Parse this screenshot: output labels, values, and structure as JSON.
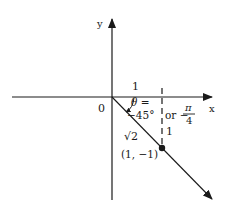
{
  "diagram": {
    "axes": {
      "x_label": "x",
      "y_label": "y",
      "origin_label": "0"
    },
    "labels": {
      "horizontal_leg": "1",
      "vertical_leg": "1",
      "hypotenuse": "√2",
      "theta_prefix": "θ =",
      "angle_degrees": "−45°",
      "or_text": "or −",
      "pi": "π",
      "denominator": "4",
      "point": "(1, −1)"
    },
    "colors": {
      "ink": "#1a1a1a",
      "background": "#ffffff"
    }
  }
}
